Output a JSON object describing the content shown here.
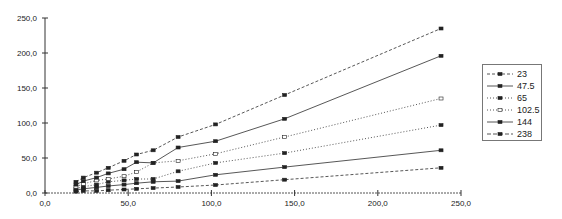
{
  "chart_data": {
    "type": "line",
    "title": "",
    "xlabel": "",
    "ylabel": "",
    "xlim": [
      0,
      250
    ],
    "ylim": [
      0,
      250
    ],
    "grid": false,
    "legend_position": "right",
    "x_ticks": [
      "0,0",
      "50,0",
      "100,0",
      "150,0",
      "200,0",
      "250,0"
    ],
    "y_ticks": [
      "0,0",
      "50,0",
      "100,0",
      "150,0",
      "200,0",
      "250,0"
    ],
    "series": [
      {
        "name": "23",
        "style": "dashed",
        "marker": "square",
        "x": [
          18.6,
          23,
          31,
          38,
          47.5,
          55,
          65,
          80,
          102.5,
          144,
          238
        ],
        "y": [
          2,
          3,
          3,
          4,
          5,
          6,
          7,
          8.6,
          11.4,
          19,
          36
        ]
      },
      {
        "name": "47.5",
        "style": "solid",
        "marker": "square",
        "x": [
          18.6,
          23,
          31,
          38,
          47.5,
          55,
          65,
          80,
          102.5,
          144,
          238
        ],
        "y": [
          4,
          6,
          8,
          10,
          12,
          14,
          16,
          17,
          26,
          37,
          61
        ]
      },
      {
        "name": "65",
        "style": "dotted",
        "marker": "square",
        "x": [
          18.6,
          23,
          31,
          38,
          47.5,
          55,
          65,
          80,
          102.5,
          144,
          238
        ],
        "y": [
          6,
          9,
          12,
          16,
          18,
          20,
          20,
          31,
          43,
          57,
          97
        ]
      },
      {
        "name": "102.5",
        "style": "dotted",
        "marker": "open-square",
        "x": [
          18.6,
          23,
          31,
          38,
          47.5,
          55,
          65,
          80,
          102.5,
          144,
          238
        ],
        "y": [
          9,
          13,
          18,
          20,
          24,
          30,
          43,
          46,
          56,
          80,
          135
        ]
      },
      {
        "name": "144",
        "style": "solid",
        "marker": "square",
        "x": [
          18.6,
          23,
          31,
          38,
          47.5,
          55,
          65,
          80,
          102.5,
          144,
          238
        ],
        "y": [
          12,
          17,
          22,
          28,
          34,
          44,
          43,
          65,
          74,
          106,
          196
        ]
      },
      {
        "name": "238",
        "style": "dashed",
        "marker": "square",
        "x": [
          18.6,
          23,
          31,
          38,
          47.5,
          55,
          65,
          80,
          102.5,
          144,
          238
        ],
        "y": [
          16,
          22,
          29,
          36,
          46,
          55,
          61,
          80,
          98,
          140,
          235
        ]
      }
    ]
  },
  "legend": {
    "items": [
      {
        "label": "23",
        "dash": "3,2",
        "open": false
      },
      {
        "label": "47.5",
        "dash": "",
        "open": false
      },
      {
        "label": "65",
        "dash": "1,2",
        "open": false
      },
      {
        "label": "102.5",
        "dash": "1,2",
        "open": true
      },
      {
        "label": "144",
        "dash": "",
        "open": false
      },
      {
        "label": "238",
        "dash": "4,2",
        "open": false
      }
    ]
  }
}
